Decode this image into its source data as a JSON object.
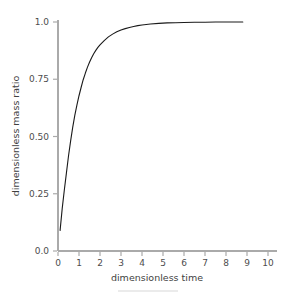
{
  "chart_data": {
    "type": "line",
    "title": "",
    "xlabel": "dimensionless time",
    "ylabel": "dimensionless mass ratio",
    "xlim": [
      -0.35,
      10.6
    ],
    "ylim": [
      -0.04,
      1.06
    ],
    "xticks": [
      0,
      1,
      2,
      3,
      4,
      5,
      6,
      7,
      8,
      9,
      10
    ],
    "xtick_labels": [
      "0",
      "1",
      "2",
      "3",
      "4",
      "5",
      "6",
      "7",
      "8",
      "9",
      "10"
    ],
    "yticks": [
      0.0,
      0.25,
      0.5,
      0.75,
      1.0
    ],
    "ytick_labels": [
      "0.0",
      "0.25",
      "0.50",
      "0.75",
      "1.0"
    ],
    "grid": false,
    "legend": false,
    "legend_position": "none",
    "line_color": "#1a1a1a",
    "axis_color": "#aaaaaa",
    "tick_label_color": "#4d4d4d",
    "background_color": "#ffffff",
    "series": [
      {
        "name": "dimensionless mass ratio",
        "x": [
          0.1,
          0.2,
          0.3,
          0.4,
          0.5,
          0.6,
          0.7,
          0.8,
          0.9,
          1.0,
          1.1,
          1.2,
          1.3,
          1.4,
          1.5,
          1.6,
          1.7,
          1.8,
          1.9,
          2.0,
          2.2,
          2.4,
          2.6,
          2.8,
          3.0,
          3.2,
          3.4,
          3.6,
          3.8,
          4.0,
          4.4,
          4.8,
          5.2,
          5.6,
          6.0,
          6.5,
          7.0,
          7.5,
          8.0,
          8.5,
          8.8
        ],
        "y": [
          0.09,
          0.185,
          0.265,
          0.34,
          0.415,
          0.48,
          0.54,
          0.592,
          0.637,
          0.678,
          0.714,
          0.748,
          0.776,
          0.802,
          0.824,
          0.844,
          0.861,
          0.876,
          0.889,
          0.9,
          0.919,
          0.935,
          0.947,
          0.957,
          0.965,
          0.971,
          0.976,
          0.98,
          0.984,
          0.987,
          0.991,
          0.994,
          0.996,
          0.997,
          0.998,
          0.999,
          0.999,
          1.0,
          1.0,
          1.0,
          1.0
        ]
      }
    ],
    "annotations": []
  },
  "footer": {
    "rule_present": true
  }
}
